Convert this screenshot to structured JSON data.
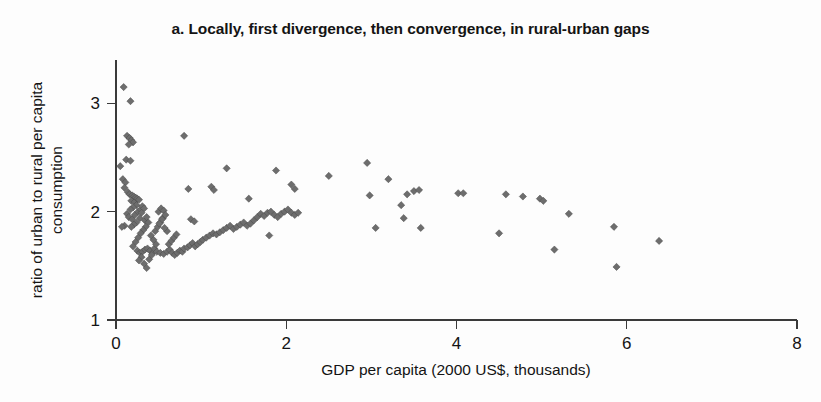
{
  "chart_data": {
    "type": "scatter",
    "title": "a. Locally, first divergence, then convergence, in rural-urban gaps",
    "xlabel": "GDP per capita (2000 US$, thousands)",
    "ylabel_line1": "ratio of urban to rural per capita",
    "ylabel_line2": "consumption",
    "ylabel": "ratio of urban to rural per capita consumption",
    "xlim": [
      0,
      8
    ],
    "ylim": [
      1,
      3.4
    ],
    "xticks": [
      0,
      2,
      4,
      6,
      8
    ],
    "xtick_labels": [
      "0",
      "2",
      "4",
      "6",
      "8"
    ],
    "yticks": [
      1,
      2,
      3
    ],
    "ytick_labels": [
      "1",
      "2",
      "3"
    ],
    "grid": false,
    "legend": "none",
    "marker": "diamond",
    "marker_color": "#6d6d6d",
    "series": [
      {
        "name": "country-year observations",
        "points": [
          [
            0.09,
            3.15
          ],
          [
            0.17,
            3.02
          ],
          [
            0.05,
            2.42
          ],
          [
            0.13,
            2.7
          ],
          [
            0.16,
            2.68
          ],
          [
            0.18,
            2.66
          ],
          [
            0.2,
            2.64
          ],
          [
            0.15,
            2.62
          ],
          [
            0.12,
            2.48
          ],
          [
            0.17,
            2.47
          ],
          [
            0.08,
            2.3
          ],
          [
            0.11,
            2.27
          ],
          [
            0.1,
            2.22
          ],
          [
            0.14,
            2.18
          ],
          [
            0.16,
            2.16
          ],
          [
            0.19,
            2.15
          ],
          [
            0.21,
            2.14
          ],
          [
            0.23,
            2.13
          ],
          [
            0.18,
            2.1
          ],
          [
            0.22,
            2.09
          ],
          [
            0.25,
            2.12
          ],
          [
            0.27,
            2.11
          ],
          [
            0.24,
            2.06
          ],
          [
            0.2,
            2.04
          ],
          [
            0.17,
            2.02
          ],
          [
            0.13,
            1.98
          ],
          [
            0.15,
            1.95
          ],
          [
            0.19,
            1.93
          ],
          [
            0.22,
            1.97
          ],
          [
            0.26,
            2.0
          ],
          [
            0.29,
            2.02
          ],
          [
            0.31,
            2.05
          ],
          [
            0.33,
            2.03
          ],
          [
            0.3,
            1.99
          ],
          [
            0.28,
            1.94
          ],
          [
            0.24,
            1.9
          ],
          [
            0.21,
            1.88
          ],
          [
            0.18,
            1.86
          ],
          [
            0.1,
            1.87
          ],
          [
            0.07,
            1.86
          ],
          [
            0.34,
            1.92
          ],
          [
            0.36,
            1.95
          ],
          [
            0.38,
            1.9
          ],
          [
            0.35,
            1.86
          ],
          [
            0.32,
            1.83
          ],
          [
            0.29,
            1.8
          ],
          [
            0.26,
            1.76
          ],
          [
            0.23,
            1.72
          ],
          [
            0.2,
            1.68
          ],
          [
            0.25,
            1.64
          ],
          [
            0.28,
            1.62
          ],
          [
            0.31,
            1.63
          ],
          [
            0.34,
            1.65
          ],
          [
            0.37,
            1.66
          ],
          [
            0.4,
            1.64
          ],
          [
            0.43,
            1.62
          ],
          [
            0.3,
            1.58
          ],
          [
            0.27,
            1.55
          ],
          [
            0.33,
            1.52
          ],
          [
            0.36,
            1.48
          ],
          [
            0.39,
            1.56
          ],
          [
            0.42,
            1.6
          ],
          [
            0.45,
            1.66
          ],
          [
            0.47,
            1.7
          ],
          [
            0.44,
            1.74
          ],
          [
            0.41,
            1.78
          ],
          [
            0.46,
            1.82
          ],
          [
            0.49,
            1.86
          ],
          [
            0.52,
            1.9
          ],
          [
            0.55,
            1.94
          ],
          [
            0.5,
            2.0
          ],
          [
            0.53,
            2.03
          ],
          [
            0.56,
            2.01
          ],
          [
            0.58,
            1.97
          ],
          [
            0.54,
            1.93
          ],
          [
            0.51,
            1.89
          ],
          [
            0.48,
            1.63
          ],
          [
            0.52,
            1.62
          ],
          [
            0.56,
            1.61
          ],
          [
            0.6,
            1.63
          ],
          [
            0.63,
            1.65
          ],
          [
            0.66,
            1.62
          ],
          [
            0.69,
            1.6
          ],
          [
            0.72,
            1.62
          ],
          [
            0.75,
            1.64
          ],
          [
            0.78,
            1.63
          ],
          [
            0.62,
            1.7
          ],
          [
            0.65,
            1.73
          ],
          [
            0.68,
            1.76
          ],
          [
            0.71,
            1.79
          ],
          [
            0.6,
            1.82
          ],
          [
            0.57,
            1.85
          ],
          [
            0.8,
            1.66
          ],
          [
            0.84,
            1.67
          ],
          [
            0.87,
            1.69
          ],
          [
            0.9,
            1.71
          ],
          [
            0.93,
            1.68
          ],
          [
            0.96,
            1.7
          ],
          [
            0.99,
            1.72
          ],
          [
            0.85,
            2.21
          ],
          [
            0.8,
            2.7
          ],
          [
            0.88,
            1.93
          ],
          [
            0.92,
            1.91
          ],
          [
            1.02,
            1.74
          ],
          [
            1.06,
            1.76
          ],
          [
            1.1,
            1.78
          ],
          [
            1.14,
            1.8
          ],
          [
            1.18,
            1.79
          ],
          [
            1.22,
            1.81
          ],
          [
            1.26,
            1.83
          ],
          [
            1.12,
            2.23
          ],
          [
            1.15,
            2.2
          ],
          [
            1.3,
            2.4
          ],
          [
            1.3,
            1.85
          ],
          [
            1.34,
            1.87
          ],
          [
            1.38,
            1.84
          ],
          [
            1.42,
            1.86
          ],
          [
            1.46,
            1.88
          ],
          [
            1.5,
            1.9
          ],
          [
            1.54,
            1.87
          ],
          [
            1.58,
            1.89
          ],
          [
            1.62,
            1.92
          ],
          [
            1.66,
            1.95
          ],
          [
            1.7,
            1.98
          ],
          [
            1.56,
            2.12
          ],
          [
            1.74,
            1.96
          ],
          [
            1.78,
            1.99
          ],
          [
            1.82,
            2.0
          ],
          [
            1.86,
            1.97
          ],
          [
            1.8,
            1.78
          ],
          [
            1.9,
            1.95
          ],
          [
            1.94,
            1.98
          ],
          [
            1.98,
            2.0
          ],
          [
            2.02,
            2.02
          ],
          [
            2.06,
            1.99
          ],
          [
            2.1,
            1.97
          ],
          [
            1.88,
            2.38
          ],
          [
            2.06,
            2.25
          ],
          [
            2.1,
            2.21
          ],
          [
            2.14,
            1.99
          ],
          [
            2.5,
            2.33
          ],
          [
            2.95,
            2.45
          ],
          [
            2.98,
            2.15
          ],
          [
            3.05,
            1.85
          ],
          [
            3.2,
            2.3
          ],
          [
            3.35,
            2.06
          ],
          [
            3.38,
            1.94
          ],
          [
            3.42,
            2.16
          ],
          [
            3.5,
            2.19
          ],
          [
            3.56,
            2.2
          ],
          [
            3.58,
            1.85
          ],
          [
            4.02,
            2.17
          ],
          [
            4.08,
            2.17
          ],
          [
            4.5,
            1.8
          ],
          [
            4.58,
            2.16
          ],
          [
            4.78,
            2.14
          ],
          [
            4.98,
            2.12
          ],
          [
            5.02,
            2.1
          ],
          [
            5.15,
            1.65
          ],
          [
            5.32,
            1.98
          ],
          [
            5.85,
            1.86
          ],
          [
            5.88,
            1.49
          ],
          [
            6.38,
            1.73
          ]
        ]
      }
    ]
  }
}
